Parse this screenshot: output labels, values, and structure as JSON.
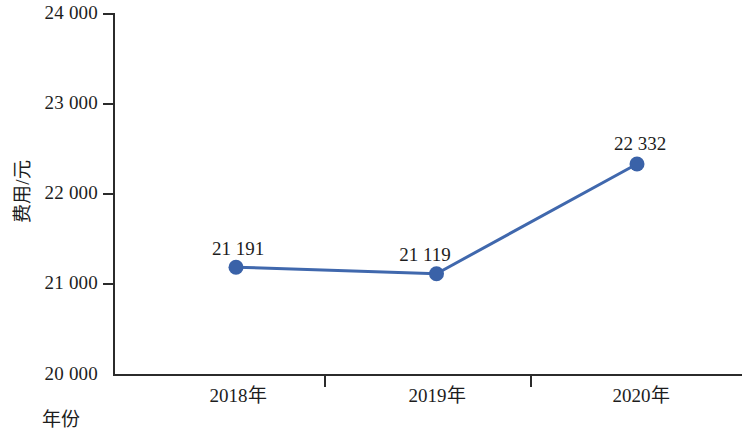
{
  "chart_data": {
    "type": "line",
    "title": "",
    "xlabel": "年份",
    "ylabel": "费用/元",
    "categories": [
      "2018年",
      "2019年",
      "2020年"
    ],
    "values": [
      21191,
      21119,
      22332
    ],
    "point_labels": [
      "21 191",
      "21 119",
      "22 332"
    ],
    "ylim": [
      20000,
      24000
    ],
    "ytick_labels": [
      "24 000",
      "23 000",
      "22 000",
      "21 000",
      "20 000"
    ],
    "ytick_values": [
      24000,
      23000,
      22000,
      21000,
      20000
    ],
    "grid": false,
    "legend": null,
    "series": [
      {
        "name": "费用/元",
        "values": [
          21191,
          21119,
          22332
        ],
        "color": "#4068ad",
        "marker": "circle",
        "line_width": 3
      }
    ]
  },
  "colors": {
    "series_blue": "#4068ad",
    "axis": "#2b2b2b",
    "text": "#1d1d1d",
    "background": "#ffffff"
  }
}
